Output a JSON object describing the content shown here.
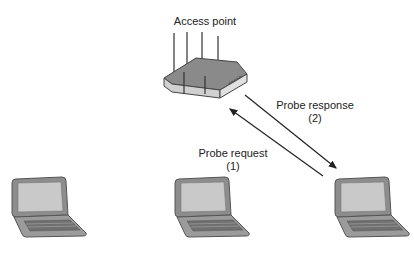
{
  "diagram": {
    "access_point": {
      "label": "Access point",
      "icon": "wireless-router-icon"
    },
    "messages": [
      {
        "label": "Probe response",
        "step": "(2)",
        "direction": "access-point-to-client"
      },
      {
        "label": "Probe request",
        "step": "(1)",
        "direction": "client-to-access-point"
      }
    ],
    "clients": [
      {
        "icon": "laptop-icon",
        "position": "left"
      },
      {
        "icon": "laptop-icon",
        "position": "center"
      },
      {
        "icon": "laptop-icon",
        "position": "right"
      }
    ],
    "colors": {
      "line": "#222222",
      "device_fill": "#9a9a9a",
      "device_screen": "#c8c8c8",
      "device_edge": "#555555"
    }
  }
}
